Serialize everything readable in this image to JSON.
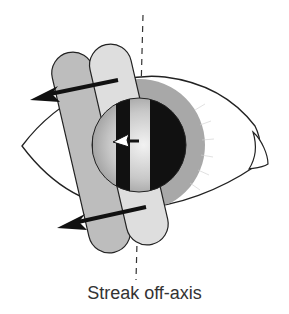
{
  "figure": {
    "caption": "Streak off-axis",
    "elements": {
      "eye_outline": "almond-shaped eye outline with caruncle at right corner",
      "iris": "gray radial iris ring",
      "pupil": "pupil with reflex showing dark/light streak bands",
      "streak_bands": [
        "darker gray band (left)",
        "lighter gray band (right)"
      ],
      "arrows": [
        "upper movement arrow pointing left",
        "lower movement arrow pointing left",
        "small reflex arrow pointing left within pupil"
      ],
      "axis_line": "dashed vertical axis line"
    },
    "colors": {
      "outline": "#222222",
      "band_dark": "#bdbdbd",
      "band_light": "#dcdcdc",
      "iris": "#a8a8a8",
      "pupil_dark": "#111111",
      "pupil_light": "#d8d8d8"
    }
  }
}
